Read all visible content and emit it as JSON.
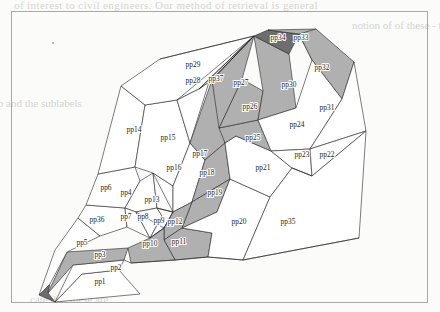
{
  "page": {
    "background_color": "#fbfbfa",
    "frame_color": "#a8a8a6"
  },
  "ghost_text": {
    "top": "of interest to civil engineers. Our method of retrieval is general",
    "left": "Two families\nof the map\nand the\nsublabels",
    "right": "notion of\nof these\n- to\n-phasis\n\nTopic spec\nWhen data is\nthe relation, the\nSo that all relations\na natural declarative\nthe knowledge base\nthe edge oriented\nmost knowledge is stored\nwith this as a\n\nDiagrammatic",
    "bottom": "cate that these are"
  },
  "figure": {
    "caption": "",
    "legend": {
      "white": "#ffffff",
      "gray": "#b0b0b0",
      "dark": "#6d6d6d",
      "outline": "#2a2a2a"
    },
    "polygons": [
      {
        "id": "pp1",
        "label": "pp1",
        "shade": "white",
        "label_x": 88,
        "label_y": 272,
        "points": "43,290 128,282 107,258 70,262"
      },
      {
        "id": "pp2",
        "label": "pp2",
        "shade": "white",
        "label_x": 104,
        "label_y": 258,
        "points": "43,290 70,262 107,258 112,248 61,253"
      },
      {
        "id": "pp3",
        "label": "pp3",
        "shade": "gray",
        "label_x": 88,
        "label_y": 245,
        "points": "36,281 61,253 112,248 116,236 55,240"
      },
      {
        "id": "pp3dark",
        "label": "",
        "shade": "dark",
        "label_x": -99,
        "label_y": -99,
        "points": "27,283 43,290 36,281 38,272"
      },
      {
        "id": "pp5",
        "label": "pp5",
        "shade": "white",
        "label_x": 70,
        "label_y": 233,
        "points": "27,283 38,272 55,240 88,224 66,206 43,238"
      },
      {
        "id": "pp36",
        "label": "pp36",
        "shade": "white",
        "label_x": 85,
        "label_y": 210,
        "points": "66,206 88,224 115,215 113,196 74,193"
      },
      {
        "id": "pp6",
        "label": "pp6",
        "shade": "white",
        "label_x": 94,
        "label_y": 178,
        "points": "74,193 113,196 128,169 123,155 86,162"
      },
      {
        "id": "pp4",
        "label": "pp4",
        "shade": "white",
        "label_x": 114,
        "label_y": 183,
        "points": "128,169 141,161 145,196 124,200 113,196"
      },
      {
        "id": "pp7",
        "label": "pp7",
        "shade": "white",
        "label_x": 114,
        "label_y": 207,
        "points": "113,196 124,200 138,226 115,215"
      },
      {
        "id": "pp8",
        "label": "pp8",
        "shade": "white",
        "label_x": 131,
        "label_y": 207,
        "points": "124,200 145,196 150,204 138,226"
      },
      {
        "id": "pp9",
        "label": "pp9",
        "shade": "white",
        "label_x": 147,
        "label_y": 211,
        "points": "145,196 161,200 152,216 138,226 150,204"
      },
      {
        "id": "pp13",
        "label": "pp13",
        "shade": "white",
        "label_x": 140,
        "label_y": 190,
        "points": "141,161 161,174 161,200 145,196"
      },
      {
        "id": "pp14",
        "label": "pp14",
        "shade": "white",
        "label_x": 122,
        "label_y": 120,
        "points": "86,162 123,155 133,93 109,74"
      },
      {
        "id": "pp15",
        "label": "pp15",
        "shade": "white",
        "label_x": 156,
        "label_y": 128,
        "points": "123,155 141,161 161,174 178,131 165,88 133,93"
      },
      {
        "id": "pp16",
        "label": "pp16",
        "shade": "white",
        "label_x": 162,
        "label_y": 158,
        "points": "161,174 178,131 193,148 180,190 161,200"
      },
      {
        "id": "pp29",
        "label": "pp29",
        "shade": "white",
        "label_x": 181,
        "label_y": 55,
        "points": "109,74 133,93 165,88 187,77 242,24 148,47"
      },
      {
        "id": "pp28",
        "label": "pp28",
        "shade": "white",
        "label_x": 181,
        "label_y": 71,
        "points": "165,88 187,77 197,70 178,131"
      },
      {
        "id": "pp37",
        "label": "pp37",
        "shade": "white",
        "label_x": 204,
        "label_y": 69,
        "points": "187,77 242,24 200,68 197,70"
      },
      {
        "id": "pp17",
        "label": "pp17",
        "shade": "gray",
        "label_x": 188,
        "label_y": 144,
        "points": "178,131 193,148 213,131 200,68"
      },
      {
        "id": "pp18",
        "label": "pp18",
        "shade": "gray",
        "label_x": 195,
        "label_y": 163,
        "points": "193,148 213,131 218,167 180,190"
      },
      {
        "id": "pp19",
        "label": "pp19",
        "shade": "gray",
        "label_x": 203,
        "label_y": 183,
        "points": "180,190 218,167 205,200 170,216"
      },
      {
        "id": "pp12",
        "label": "pp12",
        "shade": "gray",
        "label_x": 163,
        "label_y": 212,
        "points": "161,200 180,190 170,216 152,228 152,216"
      },
      {
        "id": "pp11",
        "label": "pp11",
        "shade": "gray",
        "label_x": 167,
        "label_y": 232,
        "points": "152,228 170,216 200,221 196,245 163,248"
      },
      {
        "id": "pp10",
        "label": "pp10",
        "shade": "gray",
        "label_x": 138,
        "label_y": 234,
        "points": "116,236 138,226 152,216 152,228 163,248 119,251"
      },
      {
        "id": "pp20",
        "label": "pp20",
        "shade": "white",
        "label_x": 227,
        "label_y": 212,
        "points": "196,245 200,221 170,216 205,200 218,167 258,185 231,248"
      },
      {
        "id": "pp21",
        "label": "pp21",
        "shade": "white",
        "label_x": 251,
        "label_y": 158,
        "points": "218,167 213,131 224,124 259,139 280,156 258,185"
      },
      {
        "id": "pp25",
        "label": "pp25",
        "shade": "gray",
        "label_x": 241,
        "label_y": 128,
        "points": "213,131 224,124 259,139 246,108 207,116"
      },
      {
        "id": "pp26",
        "label": "pp26",
        "shade": "gray",
        "label_x": 238,
        "label_y": 97,
        "points": "207,116 246,108 251,79 230,67"
      },
      {
        "id": "pp27",
        "label": "pp27",
        "shade": "gray",
        "label_x": 229,
        "label_y": 73,
        "points": "200,68 207,116 230,67 242,24"
      },
      {
        "id": "pp30",
        "label": "pp30",
        "shade": "gray",
        "label_x": 277,
        "label_y": 75,
        "points": "242,24 251,79 246,108 284,96 277,42"
      },
      {
        "id": "pp34",
        "label": "pp34",
        "shade": "dark",
        "label_x": 266,
        "label_y": 28,
        "points": "242,24 277,42 287,22 256,18"
      },
      {
        "id": "pp33",
        "label": "pp33",
        "shade": "gray",
        "label_x": 289,
        "label_y": 28,
        "points": "256,18 287,22 300,48 304,17"
      },
      {
        "id": "pp32",
        "label": "pp32",
        "shade": "gray",
        "label_x": 310,
        "label_y": 58,
        "points": "287,22 304,17 342,50 330,87 300,48"
      },
      {
        "id": "pp24",
        "label": "pp24",
        "shade": "white",
        "label_x": 285,
        "label_y": 115,
        "points": "246,108 284,96 300,48 330,87 298,137 259,139"
      },
      {
        "id": "pp31",
        "label": "pp31",
        "shade": "white",
        "label_x": 315,
        "label_y": 98,
        "points": "330,87 342,50 354,119 298,137"
      },
      {
        "id": "pp23",
        "label": "pp23",
        "shade": "white",
        "label_x": 290,
        "label_y": 145,
        "points": "259,139 298,137 300,164 280,156"
      },
      {
        "id": "pp22",
        "label": "pp22",
        "shade": "white",
        "label_x": 315,
        "label_y": 145,
        "points": "298,137 354,119 300,164"
      },
      {
        "id": "pp35",
        "label": "pp35",
        "shade": "white",
        "label_x": 276,
        "label_y": 212,
        "points": "258,185 280,156 300,164 354,119 347,226 231,248"
      }
    ],
    "extra_edges": [
      "M242,24 L200,68",
      "M242,24 L197,70",
      "M242,24 L187,77",
      "M242,24 L165,88",
      "M242,24 L148,47",
      "M161,200 L145,196",
      "M161,200 L141,161",
      "M152,216 L138,226",
      "M152,216 L124,200",
      "M161,200 L152,216",
      "M231,248 L347,226",
      "M196,245 L231,248",
      "M163,248 L196,245",
      "M119,251 L163,248",
      "M112,248 L119,251",
      "M300,164 L280,156"
    ]
  }
}
